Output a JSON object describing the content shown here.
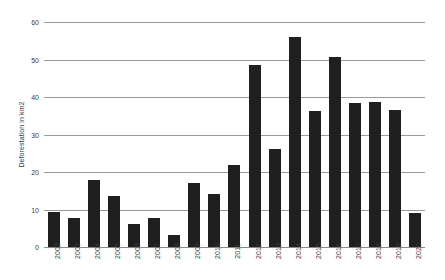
{
  "chart_data": {
    "type": "bar",
    "title": "",
    "subtitle": "",
    "xlabel": "",
    "ylabel": "Deforestation in km2",
    "categories": [
      "2002",
      "2003",
      "2004",
      "2005",
      "2006",
      "2007",
      "2008",
      "2009",
      "2010",
      "2011",
      "2012",
      "2013",
      "2014",
      "2015",
      "2016",
      "2017",
      "2018",
      "2019",
      "2020"
    ],
    "values": [
      9.4,
      7.8,
      18.0,
      13.6,
      6.2,
      7.7,
      3.2,
      17.0,
      14.2,
      21.8,
      48.5,
      26.2,
      56.0,
      36.2,
      50.7,
      38.3,
      38.8,
      36.6,
      9.0
    ],
    "series": [
      {
        "name": "Deforestation in km2",
        "values": [
          9.4,
          7.8,
          18.0,
          13.6,
          6.2,
          7.7,
          3.2,
          17.0,
          14.2,
          21.8,
          48.5,
          26.2,
          56.0,
          36.2,
          50.7,
          38.3,
          38.8,
          36.6,
          9.0
        ]
      }
    ],
    "ylim": [
      0,
      60
    ],
    "yticks": [
      0,
      10,
      20,
      30,
      40,
      50,
      60
    ],
    "ytick_labels": [
      "0",
      "10",
      "20",
      "30",
      "40",
      "50",
      "60"
    ],
    "grid": true,
    "grid_axis": "y",
    "legend": false,
    "legend_position": "none",
    "bar_color": "#1f1f1f",
    "gridline_color": "#9a9a9a",
    "axis_text_color": "#3d3d3d",
    "background_color": "#ffffff",
    "xtick_rotation": -90,
    "annotations": []
  }
}
